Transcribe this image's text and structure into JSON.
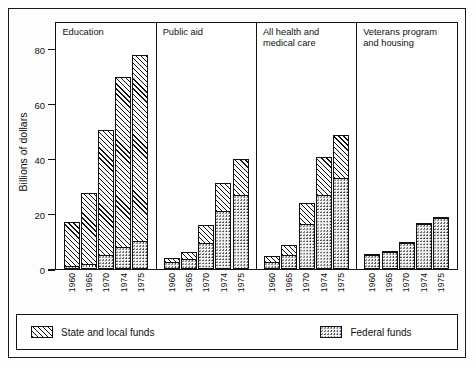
{
  "chart_data": {
    "type": "bar",
    "subtype": "stacked-grouped-panels",
    "title": "",
    "xlabel": "",
    "ylabel": "Billions of dollars",
    "ylim": [
      0,
      90
    ],
    "yticks": [
      0,
      20,
      40,
      60,
      80
    ],
    "ytick_labels": [
      "0",
      "20",
      "40",
      "60",
      "80"
    ],
    "grid": false,
    "legend_position": "bottom",
    "categories": [
      "1960",
      "1965",
      "1970",
      "1974",
      "1975"
    ],
    "series": [
      {
        "name": "State and local funds",
        "pattern": "diagonal-hatch"
      },
      {
        "name": "Federal funds",
        "pattern": "dots"
      }
    ],
    "panels": [
      {
        "label": "Education",
        "categories": [
          "1960",
          "1965",
          "1970",
          "1974",
          "1975"
        ],
        "federal": [
          1.0,
          2.0,
          5.0,
          8.0,
          10.0
        ],
        "state_local": [
          16.5,
          26.0,
          46.0,
          62.0,
          68.0
        ],
        "totals": [
          17.5,
          28.0,
          51.0,
          70.0,
          78.0
        ]
      },
      {
        "label": "Public aid",
        "categories": [
          "1960",
          "1965",
          "1970",
          "1974",
          "1975"
        ],
        "federal": [
          2.5,
          3.5,
          9.5,
          21.0,
          27.0
        ],
        "state_local": [
          2.0,
          3.0,
          7.0,
          10.5,
          13.5
        ],
        "totals": [
          4.5,
          6.5,
          16.5,
          31.5,
          40.5
        ]
      },
      {
        "label": "All health and\nmedical care",
        "categories": [
          "1960",
          "1965",
          "1970",
          "1974",
          "1975"
        ],
        "federal": [
          2.5,
          5.0,
          16.5,
          27.0,
          33.0
        ],
        "state_local": [
          2.5,
          4.0,
          8.0,
          14.0,
          16.0
        ],
        "totals": [
          5.0,
          9.0,
          24.5,
          41.0,
          49.0
        ]
      },
      {
        "label": "Veterans program\nand housing",
        "categories": [
          "1960",
          "1965",
          "1970",
          "1974",
          "1975"
        ],
        "federal": [
          5.2,
          6.2,
          9.5,
          16.5,
          18.5
        ],
        "state_local": [
          0.4,
          0.4,
          0.5,
          0.6,
          0.7
        ],
        "totals": [
          5.6,
          6.6,
          10.0,
          17.1,
          19.2
        ]
      }
    ]
  },
  "axis": {
    "y_title": "Billions of dollars",
    "y_tick_labels": [
      "80",
      "60",
      "40",
      "20",
      "0"
    ]
  },
  "legend": {
    "items": [
      {
        "label": "State and local funds",
        "pattern": "diagonal-hatch"
      },
      {
        "label": "Federal funds",
        "pattern": "dots"
      }
    ]
  }
}
